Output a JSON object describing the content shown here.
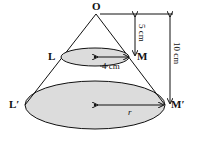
{
  "diagram": {
    "type": "cone-frustum",
    "points": {
      "apex": "O",
      "small_left": "L",
      "small_right": "M",
      "big_left": "L′",
      "big_right": "M′"
    },
    "dimensions": {
      "small_radius": "4 cm",
      "small_height": "5 cm",
      "total_height": "10 cm",
      "big_radius": "r"
    },
    "colors": {
      "stroke": "#111111",
      "fill": "#dcdcdc"
    }
  }
}
